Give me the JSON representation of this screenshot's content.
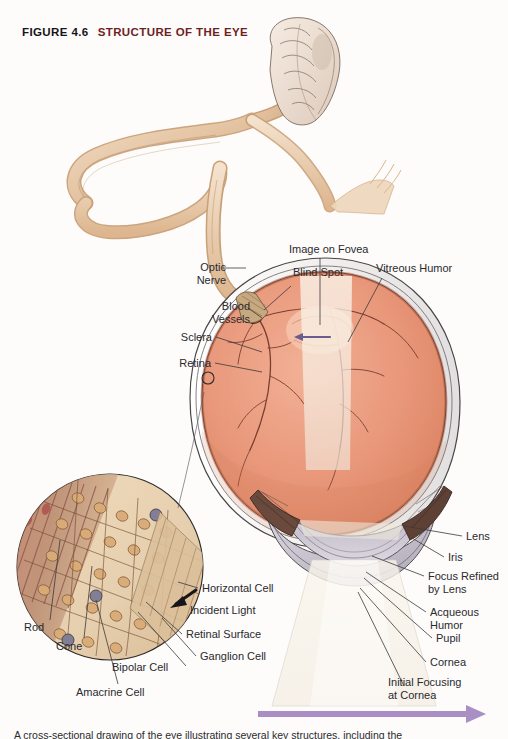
{
  "figure": {
    "number": "FIGURE 4.6",
    "name": "STRUCTURE OF THE EYE",
    "number_color": "#17141a",
    "name_color": "#6e1f23"
  },
  "caption": {
    "text": "A cross-sectional drawing of the eye illustrating several key structures, including the"
  },
  "labels": {
    "optic_nerve": "Optic\nNerve",
    "blood_vessels": "Blood\nVessels",
    "sclera": "Sclera",
    "retina": "Retina",
    "blind_spot": "Blind Spot",
    "image_on_fovea": "Image on Fovea",
    "vitreous_humor": "Vitreous Humor",
    "lens": "Lens",
    "iris": "Iris",
    "focus_refined_by_lens": "Focus Refined\nby Lens",
    "acqueous_humor": "Acqueous\nHumor",
    "pupil": "Pupil",
    "cornea": "Cornea",
    "initial_focusing_at_cornea": "Initial Focusing\nat Cornea",
    "horizontal_cell": "Horizontal Cell",
    "incident_light": "Incident Light",
    "retinal_surface": "Retinal Surface",
    "ganglion_cell": "Ganglion Cell",
    "rod": "Rod",
    "cone": "Cone",
    "bipolar_cell": "Bipolar Cell",
    "amacrine_cell": "Amacrine Cell"
  },
  "colors": {
    "background": "#fdfcfb",
    "retina_fill": "#e8977a",
    "retina_fill_light": "#f0b59c",
    "sclera_fill": "#f6f4f2",
    "nerve_tan": "#e6c9a8",
    "nerve_tan_dark": "#c9a077",
    "brain_fill": "#efe2d6",
    "lens_gray": "#cfcbd4",
    "cornea_gray": "#bdb9c4",
    "light_cone": "#f7f2ea",
    "arrow_purple": "#6b5b8e",
    "arrow_purple_light": "#a98fc4",
    "inset_fill": "#e8d3b4",
    "inset_cell": "#c89a6e",
    "leader_line": "#3a3a3e",
    "outline": "#2f2b2a"
  },
  "diagram": {
    "type": "anatomical-illustration"
  }
}
